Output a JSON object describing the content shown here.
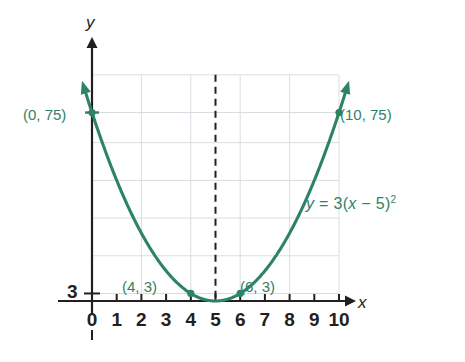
{
  "figure": {
    "axis_labels": {
      "x": "x",
      "y": "y"
    },
    "y_axis_tick_label": "3",
    "x_tick_labels": [
      "0",
      "1",
      "2",
      "3",
      "4",
      "5",
      "6",
      "7",
      "8",
      "9",
      "10"
    ],
    "equation_parts": {
      "lhs": "y",
      "eq": "=",
      "coef": "3(",
      "var": "x",
      "minus": "−",
      "rhs": "5)",
      "exp": "2"
    },
    "equation_text": "y = 3(x − 5)²",
    "point_labels": [
      "(0, 75)",
      "(4, 3)",
      "(6, 3)",
      "(10, 75)"
    ],
    "colors": {
      "curve": "#2E8266",
      "label": "#2E8266",
      "axis": "#231f20",
      "grid": "#d9dde3",
      "dashed": "#231f20",
      "background": "#ffffff"
    }
  },
  "chart_data": {
    "type": "line",
    "title": "",
    "subtitle": "",
    "xlabel": "x",
    "ylabel": "y",
    "equation": "y = 3(x − 5)²",
    "function": "3*(x-5)^2",
    "xlim": [
      -0.6,
      10.9
    ],
    "ylim": [
      -7,
      95
    ],
    "x_ticks": [
      0,
      1,
      2,
      3,
      4,
      5,
      6,
      7,
      8,
      9,
      10
    ],
    "x_tick_labels": [
      "0",
      "1",
      "2",
      "3",
      "4",
      "5",
      "6",
      "7",
      "8",
      "9",
      "10"
    ],
    "y_ticks": [
      3
    ],
    "y_tick_labels": [
      "3"
    ],
    "grid": true,
    "grid_x": [
      0,
      2,
      4,
      6,
      8,
      10
    ],
    "grid_y": [
      3,
      18,
      33,
      48,
      63,
      75,
      90
    ],
    "legend": "none",
    "annotations": [
      {
        "text": "y = 3(x − 5)²",
        "x": 8.4,
        "y": 42
      }
    ],
    "axis_of_symmetry": {
      "x": 5,
      "style": "dashed",
      "y_from": 0,
      "y_to": 90
    },
    "vertex": {
      "x": 5,
      "y": 0
    },
    "series": [
      {
        "name": "y = 3(x − 5)²",
        "x": [
          -0.25,
          0,
          1,
          2,
          3,
          4,
          5,
          6,
          7,
          8,
          9,
          10,
          10.25
        ],
        "values": [
          82.7,
          75,
          48,
          27,
          12,
          3,
          0,
          3,
          12,
          27,
          48,
          75,
          82.7
        ],
        "arrow_start": true,
        "arrow_end": true
      }
    ],
    "points": [
      {
        "label": "(0, 75)",
        "x": 0,
        "y": 75
      },
      {
        "label": "(4, 3)",
        "x": 4,
        "y": 3
      },
      {
        "label": "(6, 3)",
        "x": 6,
        "y": 3
      },
      {
        "label": "(10, 75)",
        "x": 10,
        "y": 75
      }
    ]
  }
}
